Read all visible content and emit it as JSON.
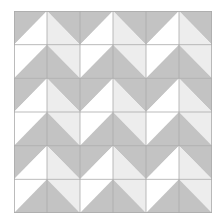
{
  "quilt": {
    "rows": 6,
    "cols": 6,
    "colors": {
      "dark": "#c3c3c3",
      "light": "#ededed",
      "white": "#ffffff",
      "line": "#a9a9a9"
    },
    "cell_types": {
      "A": {
        "diagonal": "slash",
        "top_left": "dark",
        "bottom_right": "white"
      },
      "B": {
        "diagonal": "backslash",
        "top_right": "dark",
        "bottom_left": "light"
      },
      "C": {
        "diagonal": "slash",
        "top_left": "white",
        "bottom_right": "dark"
      },
      "D": {
        "diagonal": "backslash",
        "top_right": "light",
        "bottom_left": "dark"
      }
    },
    "grid": [
      [
        "A",
        "B",
        "A",
        "B",
        "A",
        "B"
      ],
      [
        "C",
        "D",
        "C",
        "D",
        "C",
        "D"
      ],
      [
        "A",
        "B",
        "A",
        "B",
        "A",
        "B"
      ],
      [
        "C",
        "D",
        "C",
        "D",
        "C",
        "D"
      ],
      [
        "A",
        "B",
        "A",
        "B",
        "A",
        "B"
      ],
      [
        "C",
        "D",
        "C",
        "D",
        "C",
        "D"
      ]
    ]
  }
}
